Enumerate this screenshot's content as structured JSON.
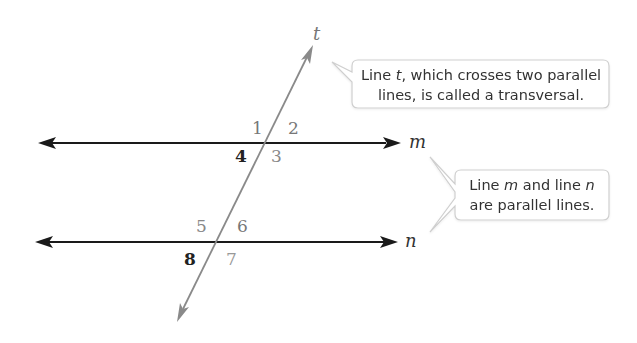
{
  "diagram": {
    "lines": {
      "transversal": {
        "label": "t",
        "color": "#8a8a8a"
      },
      "m": {
        "label": "m",
        "color": "#1a1a1a"
      },
      "n": {
        "label": "n",
        "color": "#1a1a1a"
      }
    },
    "angles": [
      {
        "id": "1",
        "label": "1",
        "intersection": "m",
        "position": "top-left",
        "color": "#777777"
      },
      {
        "id": "2",
        "label": "2",
        "intersection": "m",
        "position": "top-right",
        "color": "#777777"
      },
      {
        "id": "3",
        "label": "3",
        "intersection": "m",
        "position": "bottom-right",
        "color": "#888888"
      },
      {
        "id": "4",
        "label": "4",
        "intersection": "m",
        "position": "bottom-left",
        "color": "#222222"
      },
      {
        "id": "5",
        "label": "5",
        "intersection": "n",
        "position": "top-left",
        "color": "#888888"
      },
      {
        "id": "6",
        "label": "6",
        "intersection": "n",
        "position": "top-right",
        "color": "#777777"
      },
      {
        "id": "7",
        "label": "7",
        "intersection": "n",
        "position": "bottom-right",
        "color": "#999999"
      },
      {
        "id": "8",
        "label": "8",
        "intersection": "n",
        "position": "bottom-left",
        "color": "#222222"
      }
    ],
    "callouts": [
      {
        "id": "transversal-callout",
        "line1_pre": "Line ",
        "line1_var": "t",
        "line1_post": ", which crosses two parallel",
        "line2": "lines, is called a transversal."
      },
      {
        "id": "parallel-callout",
        "line1_pre": "Line ",
        "line1_var1": "m",
        "line1_mid": " and line ",
        "line1_var2": "n",
        "line2": "are parallel lines."
      }
    ],
    "colors": {
      "parallel_line": "#1a1a1a",
      "transversal_line": "#8a8a8a",
      "callout_border": "#cfcfcf",
      "callout_fill": "#ffffff"
    }
  }
}
